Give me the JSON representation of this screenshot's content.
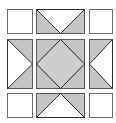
{
  "diagram": {
    "type": "quilt-block",
    "grid": "3x3",
    "colors": {
      "background": "#ffffff",
      "fill_gray": "#c4c4c4",
      "fill_white": "#ffffff",
      "stroke": "#5a5a5a",
      "stroke_dark": "#2e2e2e"
    },
    "cells": [
      {
        "row": 0,
        "col": 0,
        "pattern": "plain-white"
      },
      {
        "row": 0,
        "col": 1,
        "pattern": "flying-geese-down"
      },
      {
        "row": 0,
        "col": 2,
        "pattern": "plain-white"
      },
      {
        "row": 1,
        "col": 0,
        "pattern": "flying-geese-right"
      },
      {
        "row": 1,
        "col": 1,
        "pattern": "square-in-square"
      },
      {
        "row": 1,
        "col": 2,
        "pattern": "flying-geese-left"
      },
      {
        "row": 2,
        "col": 0,
        "pattern": "plain-white"
      },
      {
        "row": 2,
        "col": 1,
        "pattern": "flying-geese-up"
      },
      {
        "row": 2,
        "col": 2,
        "pattern": "plain-white"
      }
    ]
  }
}
